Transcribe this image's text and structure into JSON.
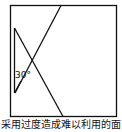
{
  "diagram": {
    "angle_label": "30°",
    "stroke_color": "#111111",
    "background": "#ffffff"
  },
  "caption": {
    "text": "采用过度造成难以利用的面"
  }
}
